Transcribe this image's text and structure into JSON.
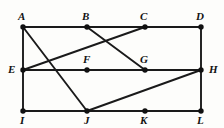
{
  "figure": {
    "kind": "undirected-graph-diagram",
    "background_color": "#fdfdfb",
    "stroke_color": "#1a1a1a",
    "vertex_fill": "#111111",
    "edge_width": 1.9,
    "vertex_radius": 2.7,
    "width": 224,
    "height": 128
  },
  "vertices": [
    {
      "id": "A",
      "label": "A",
      "x": 23,
      "y": 27,
      "label_x": 18,
      "label_y": 11,
      "anchor": "above-left"
    },
    {
      "id": "B",
      "label": "B",
      "x": 87,
      "y": 27,
      "label_x": 82,
      "label_y": 11,
      "anchor": "above-left"
    },
    {
      "id": "C",
      "label": "C",
      "x": 145,
      "y": 27,
      "label_x": 140,
      "label_y": 11,
      "anchor": "above-left"
    },
    {
      "id": "D",
      "label": "D",
      "x": 201,
      "y": 27,
      "label_x": 196,
      "label_y": 11,
      "anchor": "above-left"
    },
    {
      "id": "E",
      "label": "E",
      "x": 23,
      "y": 70,
      "label_x": 8,
      "label_y": 64,
      "anchor": "left"
    },
    {
      "id": "F",
      "label": "F",
      "x": 87,
      "y": 70,
      "label_x": 83,
      "label_y": 54,
      "anchor": "above"
    },
    {
      "id": "G",
      "label": "G",
      "x": 145,
      "y": 70,
      "label_x": 140,
      "label_y": 54,
      "anchor": "above"
    },
    {
      "id": "H",
      "label": "H",
      "x": 201,
      "y": 70,
      "label_x": 209,
      "label_y": 64,
      "anchor": "right"
    },
    {
      "id": "I",
      "label": "I",
      "x": 23,
      "y": 111,
      "label_x": 20,
      "label_y": 115,
      "anchor": "below"
    },
    {
      "id": "J",
      "label": "J",
      "x": 87,
      "y": 111,
      "label_x": 84,
      "label_y": 115,
      "anchor": "below"
    },
    {
      "id": "K",
      "label": "K",
      "x": 145,
      "y": 111,
      "label_x": 140,
      "label_y": 115,
      "anchor": "below"
    },
    {
      "id": "L",
      "label": "L",
      "x": 201,
      "y": 111,
      "label_x": 197,
      "label_y": 115,
      "anchor": "below"
    }
  ],
  "edges": [
    {
      "id": "AB",
      "from": "A",
      "to": "B",
      "kind": "horizontal"
    },
    {
      "id": "BC",
      "from": "B",
      "to": "C",
      "kind": "horizontal"
    },
    {
      "id": "CD",
      "from": "C",
      "to": "D",
      "kind": "horizontal"
    },
    {
      "id": "EF",
      "from": "E",
      "to": "F",
      "kind": "horizontal"
    },
    {
      "id": "FG",
      "from": "F",
      "to": "G",
      "kind": "horizontal"
    },
    {
      "id": "GH",
      "from": "G",
      "to": "H",
      "kind": "horizontal"
    },
    {
      "id": "IJ",
      "from": "I",
      "to": "J",
      "kind": "horizontal"
    },
    {
      "id": "JK",
      "from": "J",
      "to": "K",
      "kind": "horizontal"
    },
    {
      "id": "KL",
      "from": "K",
      "to": "L",
      "kind": "horizontal"
    },
    {
      "id": "AE",
      "from": "A",
      "to": "E",
      "kind": "vertical"
    },
    {
      "id": "EI",
      "from": "E",
      "to": "I",
      "kind": "vertical"
    },
    {
      "id": "DH",
      "from": "D",
      "to": "H",
      "kind": "vertical"
    },
    {
      "id": "HL",
      "from": "H",
      "to": "L",
      "kind": "vertical"
    },
    {
      "id": "AJ",
      "from": "A",
      "to": "J",
      "kind": "diagonal"
    },
    {
      "id": "EC",
      "from": "E",
      "to": "C",
      "kind": "diagonal"
    },
    {
      "id": "BG",
      "from": "B",
      "to": "G",
      "kind": "diagonal"
    },
    {
      "id": "JH",
      "from": "J",
      "to": "H",
      "kind": "diagonal"
    }
  ]
}
